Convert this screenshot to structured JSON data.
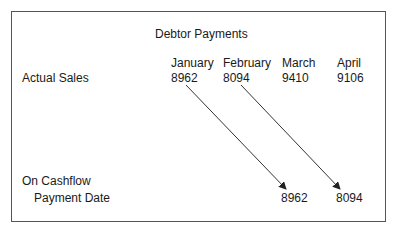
{
  "title": "Debtor Payments",
  "months": [
    "January",
    "February",
    "March",
    "April"
  ],
  "actual_sales": {
    "label": "Actual Sales",
    "values": [
      "8962",
      "8094",
      "9410",
      "9106"
    ]
  },
  "cashflow": {
    "label_line1": "On Cashflow",
    "label_line2": "Payment Date",
    "values": [
      "8962",
      "8094"
    ]
  },
  "arrows": [
    {
      "from": "January 8962",
      "to": "March 8962"
    },
    {
      "from": "February 8094",
      "to": "April 8094"
    }
  ],
  "colors": {
    "line": "#333333",
    "text": "#1a1a1a",
    "border": "#555555"
  }
}
